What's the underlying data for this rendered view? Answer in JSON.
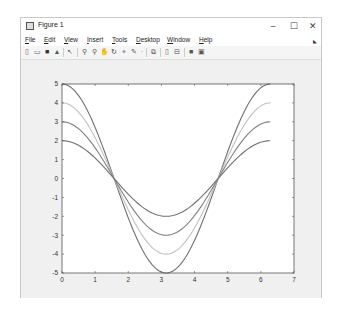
{
  "window": {
    "title": "Figure 1",
    "controls": {
      "minimize": "–",
      "maximize": "☐",
      "close": "✕"
    }
  },
  "menu": [
    "File",
    "Edit",
    "View",
    "Insert",
    "Tools",
    "Desktop",
    "Window",
    "Help"
  ],
  "toolbar": {
    "icons": [
      "new-figure-icon",
      "open-file-icon",
      "save-icon",
      "print-icon",
      "pointer-icon",
      "zoom-in-icon",
      "zoom-out-icon",
      "pan-icon",
      "rotate-3d-icon",
      "data-cursor-icon",
      "brush-icon",
      "brush-dropdown-icon",
      "link-plot-icon",
      "insert-colorbar-icon",
      "insert-legend-icon",
      "hide-plot-tools-icon",
      "show-plot-tools-icon"
    ]
  },
  "chart_data": {
    "type": "line",
    "title": "",
    "xlabel": "",
    "ylabel": "",
    "xlim": [
      0,
      7
    ],
    "ylim": [
      -5,
      5
    ],
    "xticks": [
      "0",
      "1",
      "2",
      "3",
      "4",
      "5",
      "6",
      "7"
    ],
    "yticks": [
      "5",
      "4",
      "3",
      "2",
      "1",
      "0",
      "-1",
      "-2",
      "-3",
      "-4",
      "-5"
    ],
    "grid": false,
    "legend": null,
    "x_range": [
      0,
      6.2832
    ],
    "series": [
      {
        "name": "5*cos(x)",
        "amplitude": 5,
        "color": "#707070"
      },
      {
        "name": "4*cos(x)",
        "amplitude": 4,
        "color": "#c0c0c0"
      },
      {
        "name": "3*cos(x)",
        "amplitude": 3,
        "color": "#808080"
      },
      {
        "name": "2*cos(x)",
        "amplitude": 2,
        "color": "#707070"
      }
    ],
    "sample_points": {
      "x": [
        0,
        1.5708,
        3.1416,
        4.7124,
        6.2832
      ],
      "5*cos(x)": [
        5,
        0,
        -5,
        0,
        5
      ],
      "4*cos(x)": [
        4,
        0,
        -4,
        0,
        4
      ],
      "3*cos(x)": [
        3,
        0,
        -3,
        0,
        3
      ],
      "2*cos(x)": [
        2,
        0,
        -2,
        0,
        2
      ]
    }
  }
}
